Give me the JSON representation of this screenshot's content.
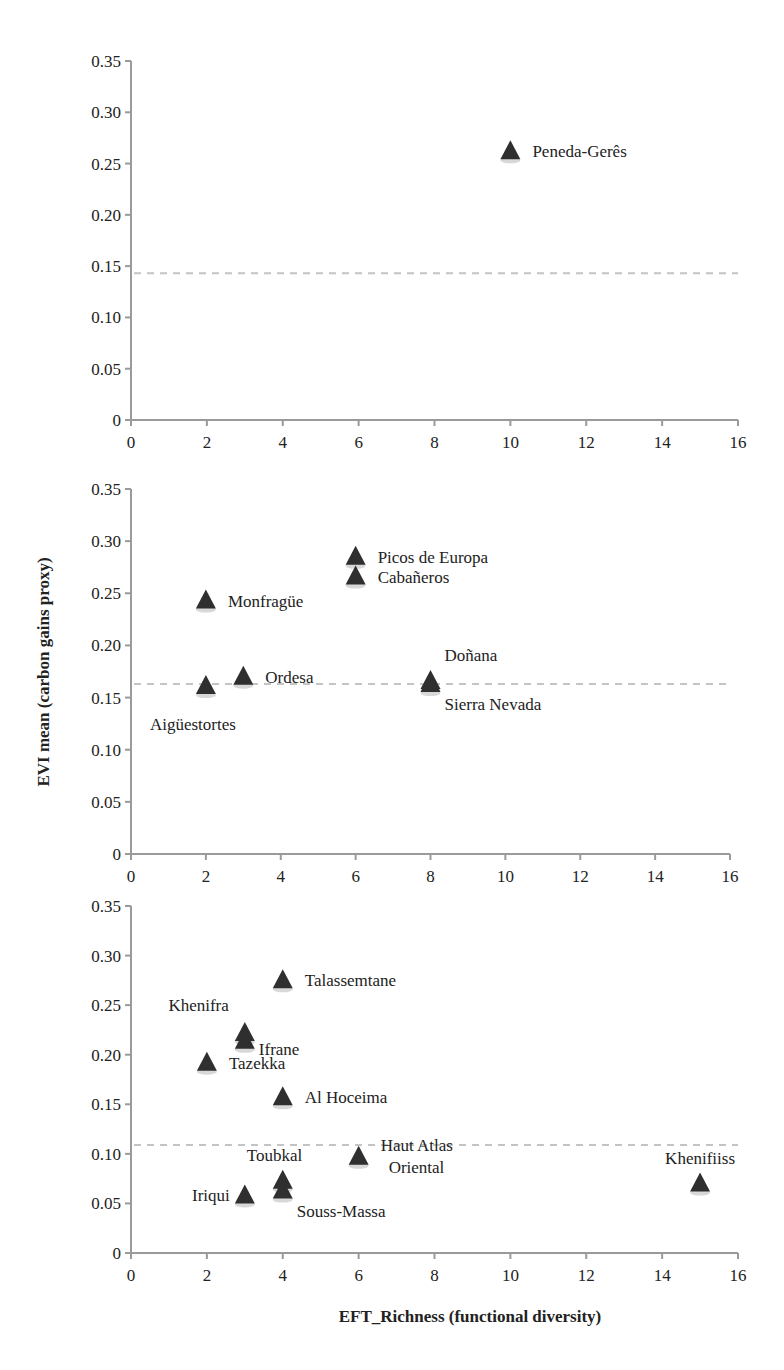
{
  "chart_data": [
    {
      "type": "scatter",
      "title": "",
      "xlabel": "",
      "ylabel": "",
      "xlim": [
        0,
        16
      ],
      "ylim": [
        0,
        0.35
      ],
      "x_ticks": [
        "0",
        "2",
        "4",
        "6",
        "8",
        "10",
        "12",
        "14",
        "16"
      ],
      "y_ticks": [
        "0",
        "0.05",
        "0.10",
        "0.15",
        "0.20",
        "0.25",
        "0.30",
        "0.35"
      ],
      "reference_line_y": 0.143,
      "marker": "triangle",
      "points": [
        {
          "label": "Peneda-Gerês",
          "x": 10,
          "y": 0.262,
          "label_pos": "right"
        }
      ]
    },
    {
      "type": "scatter",
      "title": "",
      "xlabel": "",
      "ylabel": "EVI mean (carbon gains proxy)",
      "xlim": [
        0,
        16
      ],
      "ylim": [
        0,
        0.35
      ],
      "x_ticks": [
        "0",
        "2",
        "4",
        "6",
        "8",
        "10",
        "12",
        "14",
        "16"
      ],
      "y_ticks": [
        "0",
        "0.05",
        "0.10",
        "0.15",
        "0.20",
        "0.25",
        "0.30",
        "0.35"
      ],
      "reference_line_y": 0.163,
      "marker": "triangle",
      "points": [
        {
          "label": "Monfragüe",
          "x": 2,
          "y": 0.243,
          "label_pos": "right"
        },
        {
          "label": "Aigüestortes",
          "x": 2,
          "y": 0.161,
          "label_pos": "below"
        },
        {
          "label": "Ordesa",
          "x": 3,
          "y": 0.17,
          "label_pos": "right"
        },
        {
          "label": "Picos de Europa",
          "x": 6,
          "y": 0.285,
          "label_pos": "right"
        },
        {
          "label": "Cabañeros",
          "x": 6,
          "y": 0.266,
          "label_pos": "right"
        },
        {
          "label": "Doñana",
          "x": 8,
          "y": 0.166,
          "label_pos": "above-right"
        },
        {
          "label": "Sierra Nevada",
          "x": 8,
          "y": 0.163,
          "label_pos": "below-right"
        }
      ]
    },
    {
      "type": "scatter",
      "title": "",
      "xlabel": "EFT_Richness (functional diversity)",
      "ylabel": "",
      "xlim": [
        0,
        16
      ],
      "ylim": [
        0,
        0.35
      ],
      "x_ticks": [
        "0",
        "2",
        "4",
        "6",
        "8",
        "10",
        "12",
        "14",
        "16"
      ],
      "y_ticks": [
        "0",
        "0.05",
        "0.10",
        "0.15",
        "0.20",
        "0.25",
        "0.30",
        "0.35"
      ],
      "reference_line_y": 0.109,
      "marker": "triangle",
      "points": [
        {
          "label": "Talassemtane",
          "x": 4,
          "y": 0.275,
          "label_pos": "right"
        },
        {
          "label": "Khenifra",
          "x": 3,
          "y": 0.222,
          "label_pos": "above-left"
        },
        {
          "label": "Ifrane",
          "x": 3,
          "y": 0.214,
          "label_pos": "right-low"
        },
        {
          "label": "Tazekka",
          "x": 2,
          "y": 0.192,
          "label_pos": "right"
        },
        {
          "label": "Al Hoceima",
          "x": 4,
          "y": 0.157,
          "label_pos": "right"
        },
        {
          "label": "Haut Atlas Oriental",
          "x": 6,
          "y": 0.097,
          "label_pos": "right-twoline"
        },
        {
          "label": "Toubkal",
          "x": 4,
          "y": 0.073,
          "label_pos": "above"
        },
        {
          "label": "Souss-Massa",
          "x": 4,
          "y": 0.063,
          "label_pos": "below-right"
        },
        {
          "label": "Iriqui",
          "x": 3,
          "y": 0.058,
          "label_pos": "left"
        },
        {
          "label": "Khenifiiss",
          "x": 15,
          "y": 0.07,
          "label_pos": "above"
        }
      ]
    }
  ],
  "figure": {
    "y_axis_title": "EVI mean (carbon gains proxy)",
    "x_axis_title": "EFT_Richness (functional diversity)"
  }
}
